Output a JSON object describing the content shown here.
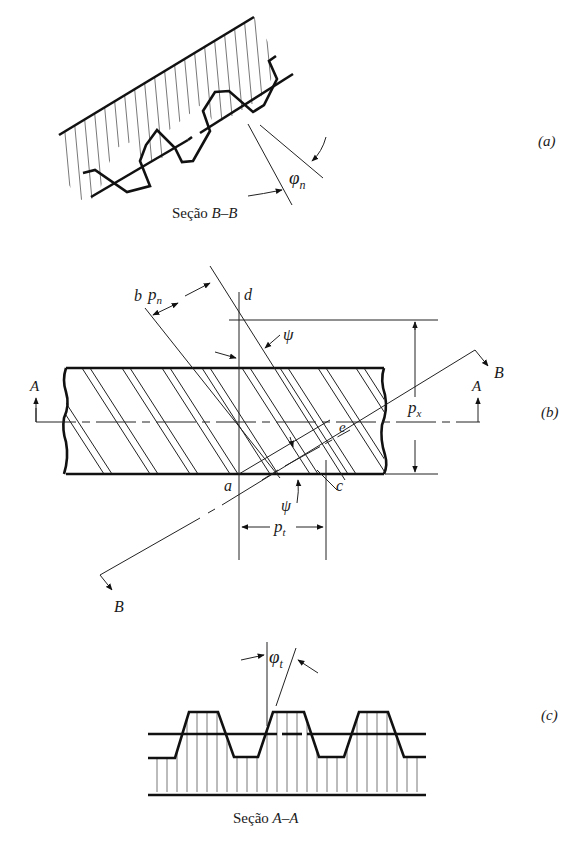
{
  "figure": {
    "panel_a": {
      "label": "(a)",
      "caption_prefix": "Seção ",
      "caption_section": "B–B",
      "angle_symbol": "φ",
      "angle_subscript": "n"
    },
    "panel_b": {
      "label": "(b)",
      "points": {
        "a": "a",
        "b": "b",
        "c": "c",
        "d": "d",
        "e": "e"
      },
      "psi_top": "ψ",
      "psi_bottom": "ψ",
      "pn_symbol": "p",
      "pn_subscript": "n",
      "px_symbol": "p",
      "px_subscript": "x",
      "pt_symbol": "p",
      "pt_subscript": "t",
      "section_A_left": "A",
      "section_A_right": "A",
      "section_B_top": "B",
      "section_B_bottom": "B"
    },
    "panel_c": {
      "label": "(c)",
      "caption_prefix": "Seção ",
      "caption_section": "A–A",
      "angle_symbol": "φ",
      "angle_subscript": "t"
    }
  }
}
